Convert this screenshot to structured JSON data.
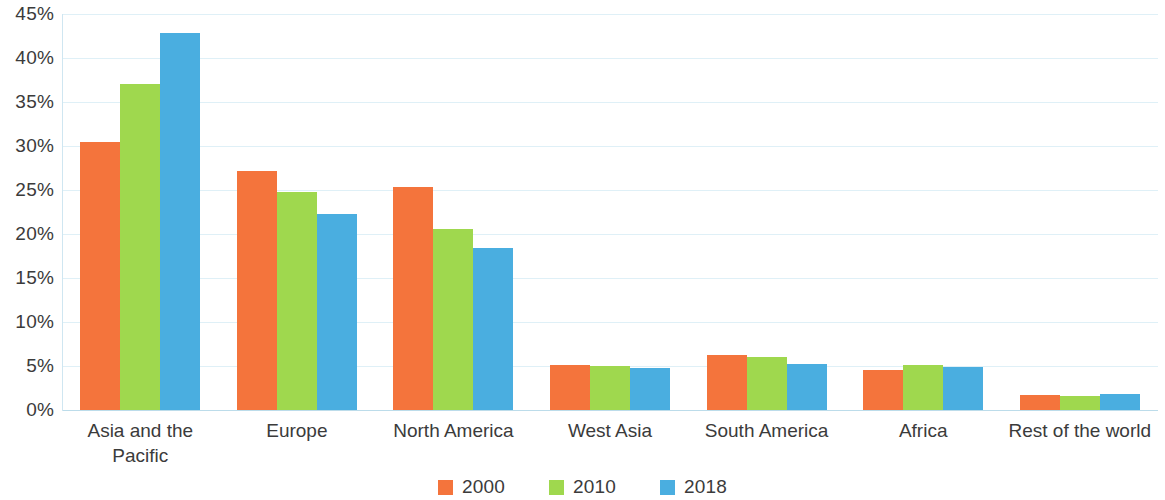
{
  "chart_data": {
    "type": "bar",
    "title": "",
    "subtitle": "",
    "xlabel": "",
    "ylabel": "",
    "ylim": [
      0,
      45
    ],
    "ytick_labels": [
      "45%",
      "40%",
      "35%",
      "30%",
      "25%",
      "20%",
      "15%",
      "10%",
      "5%",
      "0%"
    ],
    "ytick_values": [
      45,
      40,
      35,
      30,
      25,
      20,
      15,
      10,
      5,
      0
    ],
    "grid": true,
    "grid_axis": "y",
    "legend_position": "bottom-center",
    "categories": [
      "Asia and the Pacific",
      "Europe",
      "North America",
      "West Asia",
      "South America",
      "Africa",
      "Rest of the world"
    ],
    "category_label_lines": [
      [
        "Asia and the",
        "Pacific"
      ],
      [
        "Europe"
      ],
      [
        "North America"
      ],
      [
        "West Asia"
      ],
      [
        "South America"
      ],
      [
        "Africa"
      ],
      [
        "Rest of the world"
      ]
    ],
    "series": [
      {
        "name": "2000",
        "color": "#f4743c",
        "values": [
          30.4,
          27.2,
          25.3,
          5.1,
          6.2,
          4.5,
          1.7
        ]
      },
      {
        "name": "2010",
        "color": "#9fd84e",
        "values": [
          37.1,
          24.8,
          20.6,
          5.0,
          6.0,
          5.1,
          1.6
        ]
      },
      {
        "name": "2018",
        "color": "#4aaee0",
        "values": [
          42.8,
          22.3,
          18.4,
          4.8,
          5.2,
          4.9,
          1.8
        ]
      }
    ],
    "value_unit": "%"
  },
  "legend": {
    "items": [
      {
        "label": "2000",
        "color": "#f4743c"
      },
      {
        "label": "2010",
        "color": "#9fd84e"
      },
      {
        "label": "2018",
        "color": "#4aaee0"
      }
    ]
  },
  "colors": {
    "series_2000": "#f4743c",
    "series_2010": "#9fd84e",
    "series_2018": "#4aaee0",
    "gridline": "#dff0f7",
    "axis": "#cfe6f1",
    "text": "#3b3b3b",
    "background": "#ffffff"
  }
}
